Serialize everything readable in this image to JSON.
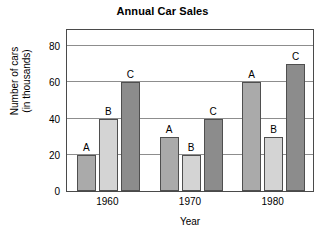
{
  "chart_data": {
    "type": "bar",
    "title": "Annual Car Sales",
    "xlabel": "Year",
    "ylabel_line1": "Number of cars",
    "ylabel_line2": "(in thousands)",
    "categories": [
      "1960",
      "1970",
      "1980"
    ],
    "series": [
      {
        "name": "A",
        "values": [
          20,
          30,
          60
        ],
        "color": "#aaaaaa"
      },
      {
        "name": "B",
        "values": [
          40,
          20,
          30
        ],
        "color": "#d4d4d4"
      },
      {
        "name": "C",
        "values": [
          60,
          40,
          70
        ],
        "color": "#8c8c8c"
      }
    ],
    "ylim": [
      0,
      90
    ],
    "yticks": [
      0,
      20,
      40,
      60,
      80
    ],
    "ytick_labels": [
      "0",
      "20",
      "40",
      "60",
      "80"
    ],
    "grid": true,
    "gridlines_at": [
      20,
      40,
      60,
      80
    ],
    "legend": "none",
    "bar_labels": [
      [
        "A",
        "B",
        "C"
      ],
      [
        "A",
        "B",
        "C"
      ],
      [
        "A",
        "B",
        "C"
      ]
    ],
    "bar_border_color": "#4f4f4f",
    "frame_color": "#4a4a4a",
    "background": "#ffffff"
  }
}
